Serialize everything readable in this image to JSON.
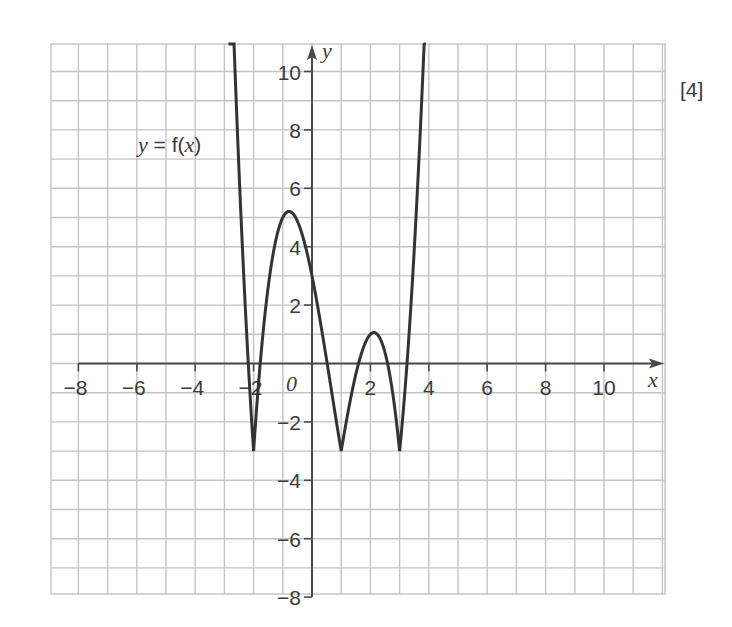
{
  "chart_data": {
    "type": "line",
    "title": "",
    "xlabel": "x",
    "ylabel": "y",
    "origin_label": "O",
    "curve_label": "y = f(x)",
    "function": "y = |(x+2)(x-1)(x-3)| - 3",
    "xlim": [
      -9,
      11.7
    ],
    "ylim": [
      -8.2,
      11
    ],
    "grid": true,
    "grid_step": 1,
    "x_ticks": [
      -8,
      -6,
      -4,
      -2,
      2,
      4,
      6,
      8,
      10
    ],
    "y_ticks": [
      -8,
      -6,
      -4,
      -2,
      2,
      4,
      6,
      8,
      10
    ],
    "key_points": [
      {
        "x": -2,
        "y": -3,
        "type": "cusp"
      },
      {
        "x": -0.55,
        "y": 5.2,
        "type": "local max"
      },
      {
        "x": 0,
        "y": 3,
        "type": "y-intercept"
      },
      {
        "x": 1,
        "y": -3,
        "type": "cusp"
      },
      {
        "x": 2.2,
        "y": 1.0,
        "type": "local max"
      },
      {
        "x": 3,
        "y": -3,
        "type": "cusp"
      }
    ],
    "series": [
      {
        "name": "y = f(x)",
        "x": [
          -2.9,
          -2.6,
          -2.3,
          -2,
          -1.7,
          -1.4,
          -1.1,
          -0.8,
          -0.55,
          -0.3,
          0,
          0.3,
          0.6,
          1,
          1.4,
          1.8,
          2.2,
          2.6,
          3,
          3.3,
          3.6,
          3.9
        ],
        "y": [
          11.2,
          6.5,
          1.8,
          -3,
          -0.3,
          1.9,
          3.5,
          4.6,
          5.2,
          4.9,
          3,
          1.1,
          -0.3,
          -3,
          0.8,
          0.7,
          1.0,
          0.8,
          -3,
          -0.2,
          3.7,
          8.0
        ]
      }
    ]
  },
  "labels": {
    "x_axis": "x",
    "y_axis": "y",
    "origin": "0",
    "curve": "y = f(x)",
    "marks": "[4]"
  },
  "colors": {
    "grid": "#c4c4c4",
    "axis": "#4a4a4a",
    "curve": "#333333",
    "text": "#3c3c3c"
  }
}
